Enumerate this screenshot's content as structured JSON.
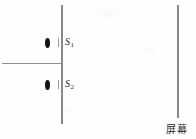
{
  "figure": {
    "kind": "youngs-double-slit-diagram",
    "background_color": "#fefefe",
    "stroke_color": "#8a8a8a",
    "ink_color": "#141414"
  },
  "barrier": {
    "name": "slit-plate",
    "x": 61,
    "top": 5,
    "height": 119
  },
  "screen": {
    "name": "viewing-screen",
    "x": 177,
    "top": 5,
    "height": 113,
    "caption": "屏幕"
  },
  "axis": {
    "name": "incident-beam-axis",
    "y": 63,
    "from_x": 2,
    "to_x": 62
  },
  "slits": [
    {
      "id": "S1",
      "label": "S",
      "subscript": "1",
      "aperture_x": 45,
      "aperture_y": 38,
      "label_x": 65,
      "label_y": 36
    },
    {
      "id": "S2",
      "label": "S",
      "subscript": "2",
      "aperture_x": 45,
      "aperture_y": 80,
      "label_x": 65,
      "label_y": 78
    }
  ]
}
